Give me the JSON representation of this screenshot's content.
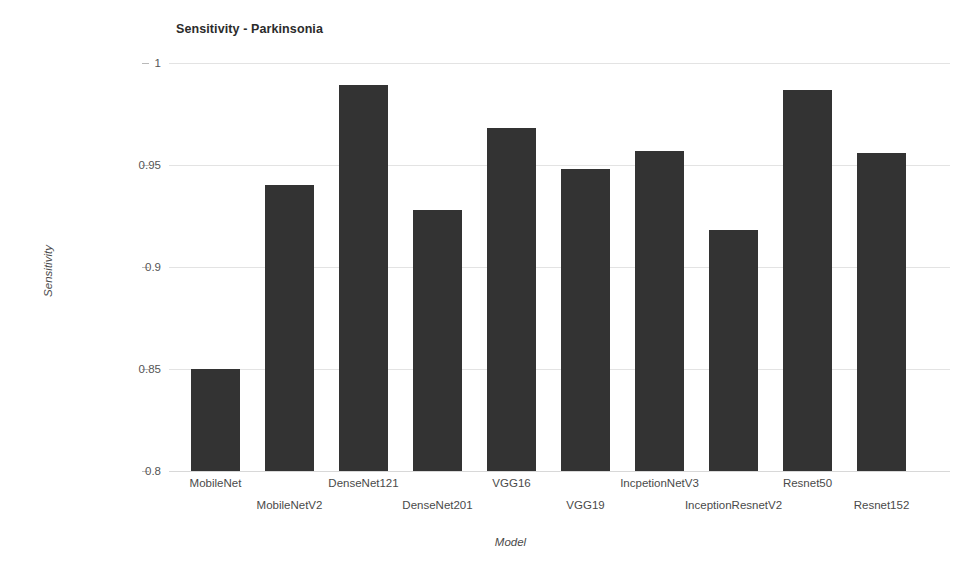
{
  "chart_data": {
    "type": "bar",
    "title": "Sensitivity - Parkinsonia",
    "xlabel": "Model",
    "ylabel": "Sensitivity",
    "categories": [
      "MobileNet",
      "MobileNetV2",
      "DenseNet121",
      "DenseNet201",
      "VGG16",
      "VGG19",
      "IncpetionNetV3",
      "InceptionResnetV2",
      "Resnet50",
      "Resnet152"
    ],
    "values": [
      0.85,
      0.94,
      0.989,
      0.928,
      0.968,
      0.948,
      0.957,
      0.918,
      0.987,
      0.956
    ],
    "ylim": [
      0.8,
      1.0
    ],
    "yticks": [
      "0.8",
      "0.85",
      "0.9",
      "0.95",
      "1"
    ],
    "ytick_values": [
      0.8,
      0.85,
      0.9,
      0.95,
      1.0
    ],
    "grid": true,
    "legend": "none",
    "bar_color": "#333333",
    "grid_color": "#e3e3e3",
    "label_rows": [
      0,
      1,
      0,
      1,
      0,
      1,
      0,
      1,
      0,
      1
    ]
  }
}
